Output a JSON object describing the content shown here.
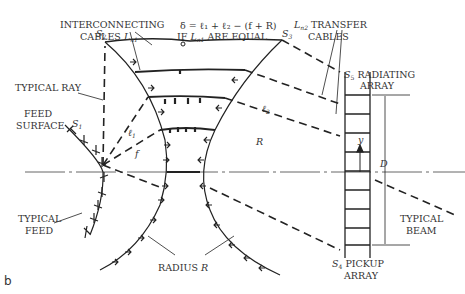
{
  "figure": {
    "panel_label": "b",
    "labels": {
      "interconnecting": "INTERCONNECTING",
      "cables_ln1": "CABLES",
      "l_symbol": "L",
      "n1": "n1",
      "n2": "n2",
      "formula": "δ = ℓ₁ + ℓ₂ − (f + R)",
      "if_equal_prefix": "IF",
      "if_equal_suffix": "ARE EQUAL",
      "transfer": "TRANSFER",
      "transfer_cables": "CABLES",
      "s2": "S",
      "s2_sub": "2",
      "s3": "S",
      "s3_sub": "3",
      "s1": "S",
      "s1_sub": "1",
      "s4": "S",
      "s4_sub": "4",
      "s5": "S",
      "s5_sub": "5",
      "radiating": "RADIATING",
      "array": "ARRAY",
      "pickup": "PICKUP",
      "pickup_array": "ARRAY",
      "typical_ray": "TYPICAL RAY",
      "feed": "FEED",
      "surface": "SURFACE",
      "typical_feed_1": "TYPICAL",
      "typical_feed_2": "FEED",
      "typical_beam_1": "TYPICAL",
      "typical_beam_2": "BEAM",
      "radius": "RADIUS",
      "radius_sym": "R",
      "l1": "ℓ",
      "l1_sub": "1",
      "l2": "ℓ",
      "l2_sub": "2",
      "f": "f",
      "R": "R",
      "y": "y",
      "D": "D"
    }
  }
}
